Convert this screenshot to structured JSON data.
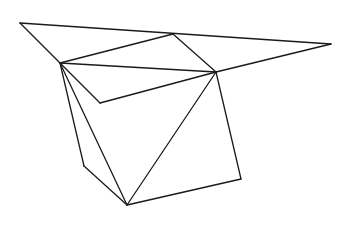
{
  "diagram": {
    "type": "line-drawing",
    "stroke_color": "#1a1a1a",
    "background": "#ffffff",
    "vertices": {
      "TL": [
        20,
        23
      ],
      "T": [
        173,
        34
      ],
      "TR": [
        331,
        44
      ],
      "L": [
        60,
        63
      ],
      "R": [
        216,
        72
      ],
      "V": [
        100,
        103
      ],
      "LL": [
        84,
        166
      ],
      "B": [
        127,
        205
      ],
      "LR": [
        241,
        179
      ]
    },
    "edges": [
      [
        "TL",
        "TR"
      ],
      [
        "TL",
        "L"
      ],
      [
        "L",
        "T"
      ],
      [
        "T",
        "R"
      ],
      [
        "R",
        "TR"
      ],
      [
        "L",
        "R"
      ],
      [
        "L",
        "V"
      ],
      [
        "V",
        "R"
      ],
      [
        "L",
        "LL"
      ],
      [
        "LL",
        "B"
      ],
      [
        "L",
        "B"
      ],
      [
        "R",
        "B"
      ],
      [
        "R",
        "LR"
      ],
      [
        "LR",
        "B"
      ]
    ]
  }
}
